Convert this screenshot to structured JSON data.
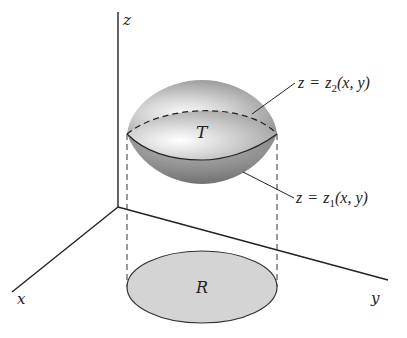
{
  "diagram": {
    "type": "3D region between two surfaces over a planar region",
    "axes": {
      "z_label": "z",
      "x_label": "x",
      "y_label": "y"
    },
    "solid_label": "T",
    "region_label": "R",
    "upper_surface": {
      "lhs": "z",
      "eq": "=",
      "fn": "z",
      "sub": "2",
      "args": "(x, y)"
    },
    "lower_surface": {
      "lhs": "z",
      "eq": "=",
      "fn": "z",
      "sub": "1",
      "args": "(x, y)"
    },
    "colors": {
      "axis": "#222222",
      "solid_dark": "#7a7a7a",
      "solid_light": "#f4f4f4",
      "region_fill": "#d4d4d4"
    }
  }
}
